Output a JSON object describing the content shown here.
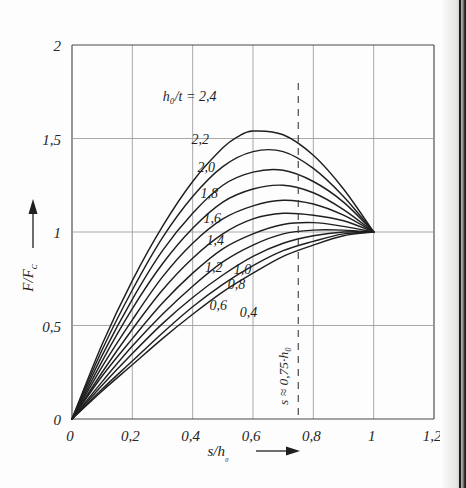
{
  "figure": {
    "kind": "technical-diagram-chart",
    "background_color": "#fdfdfd",
    "ink_color": "#1f1f1f",
    "grid_color": "#9a9a9a",
    "page_edge_color": "#1b1b1b"
  },
  "chart_data": {
    "type": "line",
    "title": "",
    "xlabel": "s/h0",
    "xlabel_display": "s/h₀",
    "ylabel": "F/FC",
    "ylabel_display": "F/Fᴄ",
    "xlim": [
      0,
      1.2
    ],
    "ylim": [
      0,
      2
    ],
    "grid": true,
    "legend_position": "inline-curve-labels",
    "xticks": [
      0,
      0.2,
      0.4,
      0.6,
      0.8,
      1,
      1.2
    ],
    "xticklabels": [
      "0",
      "0,2",
      "0,4",
      "0,6",
      "0,8",
      "1",
      "1,2"
    ],
    "yticks": [
      0,
      0.5,
      1,
      1.5,
      2
    ],
    "yticklabels": [
      "0",
      "0,5",
      "1",
      "1,5",
      "2"
    ],
    "series_parameter": "h0/t",
    "series_parameter_display": "h₀/t",
    "series_parameter_label": "h₀/t = 2,4",
    "annotations": [
      {
        "name": "s-approx-line",
        "text": "s ≈ 0,75·h₀",
        "x": 0.75,
        "orientation": "vertical-dashed"
      }
    ],
    "common_points": [
      [
        0,
        0
      ],
      [
        1,
        1
      ]
    ],
    "series": [
      {
        "name": "2,4",
        "h0_t": 2.4,
        "label_x": 0.39,
        "label_y": 1.7,
        "peak_x": 0.55,
        "peak_y": 1.57,
        "values": [
          [
            0,
            0
          ],
          [
            0.1,
            0.4
          ],
          [
            0.2,
            0.74
          ],
          [
            0.3,
            1.03
          ],
          [
            0.4,
            1.27
          ],
          [
            0.5,
            1.45
          ],
          [
            0.55,
            1.51
          ],
          [
            0.6,
            1.54
          ],
          [
            0.7,
            1.52
          ],
          [
            0.8,
            1.41
          ],
          [
            0.9,
            1.23
          ],
          [
            1.0,
            1.0
          ]
        ]
      },
      {
        "name": "2,2",
        "h0_t": 2.2,
        "label_x": 0.425,
        "label_y": 1.47,
        "peak_x": 0.55,
        "peak_y": 1.44,
        "values": [
          [
            0,
            0
          ],
          [
            0.1,
            0.37
          ],
          [
            0.2,
            0.69
          ],
          [
            0.3,
            0.97
          ],
          [
            0.4,
            1.19
          ],
          [
            0.5,
            1.35
          ],
          [
            0.6,
            1.43
          ],
          [
            0.7,
            1.43
          ],
          [
            0.8,
            1.34
          ],
          [
            0.9,
            1.19
          ],
          [
            1.0,
            1.0
          ]
        ]
      },
      {
        "name": "2,0",
        "h0_t": 2.0,
        "label_x": 0.445,
        "label_y": 1.32,
        "peak_x": 0.56,
        "peak_y": 1.33,
        "values": [
          [
            0,
            0
          ],
          [
            0.1,
            0.34
          ],
          [
            0.2,
            0.64
          ],
          [
            0.3,
            0.9
          ],
          [
            0.4,
            1.1
          ],
          [
            0.5,
            1.25
          ],
          [
            0.6,
            1.32
          ],
          [
            0.7,
            1.33
          ],
          [
            0.8,
            1.27
          ],
          [
            0.9,
            1.16
          ],
          [
            1.0,
            1.0
          ]
        ]
      },
      {
        "name": "1,8",
        "h0_t": 1.8,
        "label_x": 0.455,
        "label_y": 1.18,
        "peak_x": 0.57,
        "peak_y": 1.24,
        "values": [
          [
            0,
            0
          ],
          [
            0.1,
            0.31
          ],
          [
            0.2,
            0.59
          ],
          [
            0.3,
            0.83
          ],
          [
            0.4,
            1.02
          ],
          [
            0.5,
            1.16
          ],
          [
            0.6,
            1.23
          ],
          [
            0.7,
            1.25
          ],
          [
            0.8,
            1.21
          ],
          [
            0.9,
            1.12
          ],
          [
            1.0,
            1.0
          ]
        ]
      },
      {
        "name": "1,6",
        "h0_t": 1.6,
        "label_x": 0.465,
        "label_y": 1.05,
        "peak_x": 0.58,
        "peak_y": 1.16,
        "values": [
          [
            0,
            0
          ],
          [
            0.1,
            0.28
          ],
          [
            0.2,
            0.53
          ],
          [
            0.3,
            0.76
          ],
          [
            0.4,
            0.94
          ],
          [
            0.5,
            1.07
          ],
          [
            0.6,
            1.14
          ],
          [
            0.7,
            1.17
          ],
          [
            0.8,
            1.15
          ],
          [
            0.9,
            1.09
          ],
          [
            1.0,
            1.0
          ]
        ]
      },
      {
        "name": "1,4",
        "h0_t": 1.4,
        "label_x": 0.475,
        "label_y": 0.93,
        "peak_x": 0.6,
        "peak_y": 1.09,
        "values": [
          [
            0,
            0
          ],
          [
            0.1,
            0.25
          ],
          [
            0.2,
            0.48
          ],
          [
            0.3,
            0.69
          ],
          [
            0.4,
            0.86
          ],
          [
            0.5,
            0.99
          ],
          [
            0.6,
            1.07
          ],
          [
            0.7,
            1.1
          ],
          [
            0.8,
            1.09
          ],
          [
            0.9,
            1.06
          ],
          [
            1.0,
            1.0
          ]
        ]
      },
      {
        "name": "1,2",
        "h0_t": 1.2,
        "label_x": 0.47,
        "label_y": 0.785,
        "peak_x": 0.62,
        "peak_y": 1.04,
        "values": [
          [
            0,
            0
          ],
          [
            0.1,
            0.23
          ],
          [
            0.2,
            0.43
          ],
          [
            0.3,
            0.62
          ],
          [
            0.4,
            0.78
          ],
          [
            0.5,
            0.91
          ],
          [
            0.6,
            0.99
          ],
          [
            0.7,
            1.04
          ],
          [
            0.8,
            1.05
          ],
          [
            0.9,
            1.03
          ],
          [
            1.0,
            1.0
          ]
        ]
      },
      {
        "name": "1,0",
        "h0_t": 1.0,
        "label_x": 0.565,
        "label_y": 0.775,
        "peak_x": 0.65,
        "peak_y": 1.0,
        "values": [
          [
            0,
            0
          ],
          [
            0.1,
            0.2
          ],
          [
            0.2,
            0.39
          ],
          [
            0.3,
            0.56
          ],
          [
            0.4,
            0.71
          ],
          [
            0.5,
            0.84
          ],
          [
            0.6,
            0.93
          ],
          [
            0.7,
            0.99
          ],
          [
            0.8,
            1.01
          ],
          [
            0.9,
            1.01
          ],
          [
            1.0,
            1.0
          ]
        ]
      },
      {
        "name": "0,8",
        "h0_t": 0.8,
        "label_x": 0.545,
        "label_y": 0.695,
        "peak_x": 0.7,
        "peak_y": 0.98,
        "values": [
          [
            0,
            0
          ],
          [
            0.1,
            0.18
          ],
          [
            0.2,
            0.35
          ],
          [
            0.3,
            0.51
          ],
          [
            0.4,
            0.65
          ],
          [
            0.5,
            0.77
          ],
          [
            0.6,
            0.87
          ],
          [
            0.7,
            0.94
          ],
          [
            0.8,
            0.98
          ],
          [
            0.9,
            1.0
          ],
          [
            1.0,
            1.0
          ]
        ]
      },
      {
        "name": "0,6",
        "h0_t": 0.6,
        "label_x": 0.485,
        "label_y": 0.585,
        "peak_x": 0.78,
        "peak_y": 0.97,
        "values": [
          [
            0,
            0
          ],
          [
            0.1,
            0.16
          ],
          [
            0.2,
            0.31
          ],
          [
            0.3,
            0.46
          ],
          [
            0.4,
            0.6
          ],
          [
            0.5,
            0.72
          ],
          [
            0.6,
            0.82
          ],
          [
            0.7,
            0.9
          ],
          [
            0.8,
            0.95
          ],
          [
            0.9,
            0.99
          ],
          [
            1.0,
            1.0
          ]
        ]
      },
      {
        "name": "0,4",
        "h0_t": 0.4,
        "label_x": 0.585,
        "label_y": 0.545,
        "peak_x": 0.86,
        "peak_y": 0.98,
        "values": [
          [
            0,
            0
          ],
          [
            0.1,
            0.15
          ],
          [
            0.2,
            0.29
          ],
          [
            0.3,
            0.43
          ],
          [
            0.4,
            0.56
          ],
          [
            0.5,
            0.68
          ],
          [
            0.6,
            0.78
          ],
          [
            0.7,
            0.87
          ],
          [
            0.8,
            0.93
          ],
          [
            0.9,
            0.98
          ],
          [
            1.0,
            1.0
          ]
        ]
      }
    ]
  }
}
